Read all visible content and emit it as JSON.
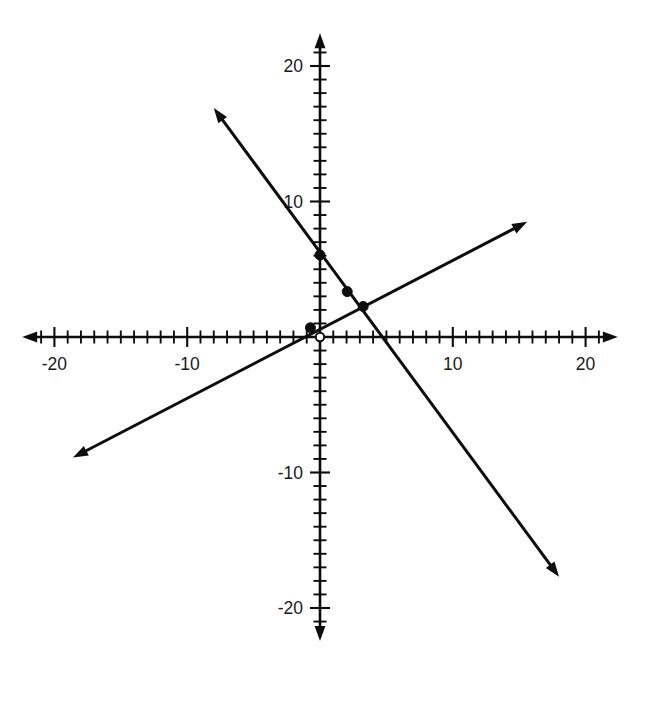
{
  "chart_data": {
    "type": "line",
    "title": "",
    "subtitle": "",
    "xlabel": "",
    "ylabel": "",
    "xlim": [
      -22.5,
      22.5
    ],
    "ylim": [
      -22.5,
      22.5
    ],
    "grid": false,
    "legend": "none",
    "axis_style": "cartesian-crosshair-with-arrows",
    "x_tick_labels": [
      "-20",
      "-10",
      "10",
      "20"
    ],
    "x_tick_values": [
      -20,
      -10,
      10,
      20
    ],
    "y_tick_labels": [
      "20",
      "10",
      "-10",
      "-20"
    ],
    "y_tick_values": [
      20,
      10,
      -10,
      -20
    ],
    "minor_tick_interval": 1,
    "major_tick_interval": 10,
    "series": [
      {
        "name": "decreasing-line",
        "slope": -1.33,
        "intercept": 6.2,
        "x": [
          -8.0,
          18.0
        ],
        "values": [
          16.9,
          -17.7
        ],
        "arrow_start": true,
        "arrow_end": true
      },
      {
        "name": "increasing-line",
        "slope": 0.51,
        "intercept": 0.55,
        "x": [
          -18.6,
          15.6
        ],
        "values": [
          -8.9,
          8.5
        ],
        "arrow_start": true,
        "arrow_end": true
      }
    ],
    "points": [
      {
        "name": "y-intercept-point",
        "x": 0,
        "y": 6.05,
        "style": "filled"
      },
      {
        "name": "origin-point",
        "x": 0,
        "y": 0,
        "style": "open"
      },
      {
        "name": "near-origin-point",
        "x": -0.72,
        "y": 0.68,
        "style": "filled"
      },
      {
        "name": "mid-point",
        "x": 2.05,
        "y": 3.35,
        "style": "filled"
      },
      {
        "name": "intersection-point",
        "x": 3.25,
        "y": 2.25,
        "style": "filled"
      }
    ],
    "annotations": []
  }
}
